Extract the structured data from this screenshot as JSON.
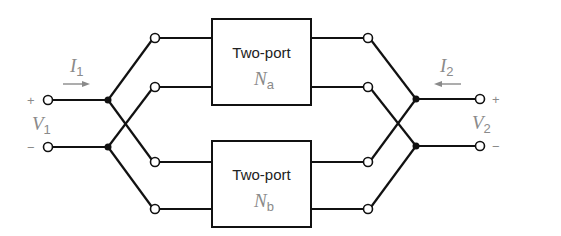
{
  "diagram": {
    "type": "circuit",
    "networks": [
      {
        "label": "Two-port",
        "name": "N",
        "sub": "a"
      },
      {
        "label": "Two-port",
        "name": "N",
        "sub": "b"
      }
    ],
    "port1": {
      "current": "I",
      "current_sub": "1",
      "voltage": "V",
      "voltage_sub": "1",
      "plus": "+",
      "minus": "−"
    },
    "port2": {
      "current": "I",
      "current_sub": "2",
      "voltage": "V",
      "voltage_sub": "2",
      "plus": "+",
      "minus": "−"
    },
    "colors": {
      "wire": "#111111",
      "label": "#8a8a8a",
      "background": "#ffffff"
    }
  }
}
